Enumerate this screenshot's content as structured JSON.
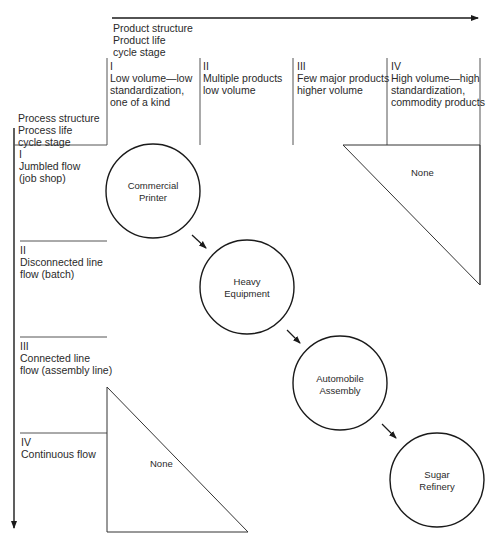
{
  "axes": {
    "product": {
      "title_lines": [
        "Product structure",
        "Product life",
        "cycle stage"
      ],
      "columns": [
        {
          "numeral": "I",
          "lines": [
            "Low volume—low",
            "standardization,",
            "one of a kind"
          ]
        },
        {
          "numeral": "II",
          "lines": [
            "Multiple products",
            "low volume"
          ]
        },
        {
          "numeral": "III",
          "lines": [
            "Few major products",
            "higher volume"
          ]
        },
        {
          "numeral": "IV",
          "lines": [
            "High volume—high",
            "standardization,",
            "commodity products"
          ]
        }
      ]
    },
    "process": {
      "title_lines": [
        "Process structure",
        "Process life",
        "cycle stage"
      ],
      "rows": [
        {
          "numeral": "I",
          "lines": [
            "Jumbled flow",
            "(job shop)"
          ]
        },
        {
          "numeral": "II",
          "lines": [
            "Disconnected line",
            "flow (batch)"
          ]
        },
        {
          "numeral": "III",
          "lines": [
            "Connected line",
            "flow (assembly line)"
          ]
        },
        {
          "numeral": "IV",
          "lines": [
            "Continuous flow"
          ]
        }
      ]
    }
  },
  "nodes": [
    {
      "id": "commercial-printer",
      "lines": [
        "Commercial",
        "Printer"
      ]
    },
    {
      "id": "heavy-equipment",
      "lines": [
        "Heavy",
        "Equipment"
      ]
    },
    {
      "id": "automobile-assembly",
      "lines": [
        "Automobile",
        "Assembly"
      ]
    },
    {
      "id": "sugar-refinery",
      "lines": [
        "Sugar",
        "Refinery"
      ]
    }
  ],
  "regions": {
    "top_right_triangle": "None",
    "bottom_left_triangle": "None"
  },
  "colors": {
    "line": "#1a1a1a",
    "thin_line": "#555555",
    "background": "#ffffff"
  }
}
